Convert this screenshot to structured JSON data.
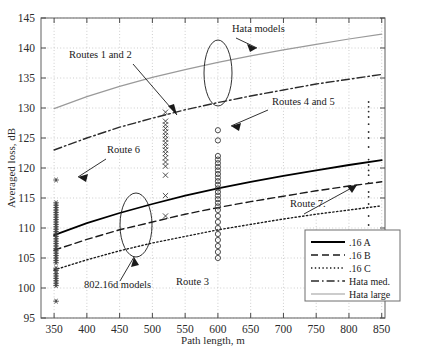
{
  "chart_data": {
    "type": "scatter",
    "title": "",
    "xlabel": "Path length, m",
    "ylabel": "Averaged loss, dB",
    "xlim": [
      330,
      855
    ],
    "ylim": [
      95,
      145
    ],
    "xticks": [
      350,
      400,
      450,
      500,
      550,
      600,
      650,
      700,
      750,
      800,
      850
    ],
    "yticks": [
      95,
      100,
      105,
      110,
      115,
      120,
      125,
      130,
      135,
      140,
      145
    ],
    "grid": "dotted",
    "legend_position": "lower-right",
    "legend": [
      {
        "label": ".16 A",
        "style": "solid",
        "color": "#000000",
        "width": 1.8
      },
      {
        "label": ".16  B",
        "style": "dashed",
        "color": "#1a1a1a",
        "width": 1.5
      },
      {
        "label": ".16 C",
        "style": "dotted",
        "color": "#1a1a1a",
        "width": 1.4
      },
      {
        "label": "Hata med.",
        "style": "dashdot",
        "color": "#2a2a2a",
        "width": 1.4
      },
      {
        "label": "Hata large",
        "style": "solid",
        "color": "#9a9a9a",
        "width": 1.2
      }
    ],
    "series": [
      {
        "name": ".16 A",
        "style": "solid",
        "color": "#000000",
        "x": [
          350,
          400,
          450,
          500,
          550,
          600,
          650,
          700,
          750,
          800,
          850
        ],
        "y": [
          108.8,
          110.8,
          112.5,
          114.0,
          115.4,
          116.6,
          117.7,
          118.7,
          119.6,
          120.5,
          121.3
        ]
      },
      {
        "name": ".16  B",
        "style": "dashed",
        "color": "#1a1a1a",
        "x": [
          350,
          400,
          450,
          500,
          550,
          600,
          650,
          700,
          750,
          800,
          850
        ],
        "y": [
          106.3,
          108.1,
          109.7,
          111.0,
          112.3,
          113.4,
          114.4,
          115.3,
          116.2,
          117.0,
          117.7
        ]
      },
      {
        "name": ".16 C",
        "style": "dotted",
        "color": "#1a1a1a",
        "x": [
          350,
          400,
          450,
          500,
          550,
          600,
          650,
          700,
          750,
          800,
          850
        ],
        "y": [
          103.0,
          104.7,
          106.2,
          107.5,
          108.6,
          109.7,
          110.6,
          111.5,
          112.3,
          113.0,
          113.7
        ]
      },
      {
        "name": "Hata med.",
        "style": "dashdot",
        "color": "#2a2a2a",
        "x": [
          350,
          400,
          450,
          500,
          550,
          600,
          650,
          700,
          750,
          800,
          850
        ],
        "y": [
          123.0,
          125.0,
          126.8,
          128.3,
          129.7,
          130.9,
          132.0,
          133.0,
          134.0,
          134.8,
          135.6
        ]
      },
      {
        "name": "Hata large",
        "style": "solid",
        "color": "#9a9a9a",
        "x": [
          350,
          400,
          450,
          500,
          550,
          600,
          650,
          700,
          750,
          800,
          850
        ],
        "y": [
          129.9,
          131.9,
          133.6,
          135.1,
          136.4,
          137.6,
          138.7,
          139.7,
          140.6,
          141.5,
          142.3
        ]
      }
    ],
    "scatter_groups": [
      {
        "name": "802.16d models measurement cluster",
        "marker": "asterisk",
        "color": "#3a3a3a",
        "x": 353,
        "y": [
          97.8,
          100.4,
          100.8,
          101.2,
          101.6,
          102.0,
          102.4,
          102.9,
          103.3,
          104.2,
          104.6,
          105.0,
          105.4,
          105.8,
          106.2,
          106.6,
          107.0,
          107.4,
          107.8,
          108.2,
          108.6,
          109.0,
          109.4,
          109.8,
          110.2,
          110.6,
          111.0,
          111.4,
          111.8,
          112.2,
          112.6,
          113.0,
          113.4,
          113.8,
          114.2,
          118.0
        ]
      },
      {
        "name": "Routes 1 and 2 cluster",
        "marker": "cross",
        "color": "#3a3a3a",
        "x": 520,
        "y": [
          112.0,
          115.4,
          118.8,
          120.3,
          121.0,
          121.7,
          122.4,
          123.0,
          123.6,
          124.2,
          124.8,
          125.4,
          126.0,
          126.6,
          127.2,
          127.8,
          129.3
        ]
      },
      {
        "name": "Routes 4 and 5 cluster",
        "marker": "circle",
        "color": "#3a3a3a",
        "x": 600,
        "y": [
          105.0,
          106.0,
          107.0,
          108.0,
          109.0,
          110.0,
          111.0,
          112.0,
          113.0,
          113.6,
          114.2,
          114.8,
          115.4,
          116.0,
          116.6,
          117.2,
          117.8,
          118.4,
          119.0,
          119.6,
          120.2,
          120.8,
          121.4,
          122.0,
          124.6,
          126.3
        ]
      },
      {
        "name": "Route 7 cluster",
        "marker": "dot",
        "color": "#2a2a2a",
        "x": 830,
        "y": [
          103.5,
          105.0,
          108.0,
          110.5,
          112.0,
          114.0,
          115.2,
          116.0,
          117.5,
          118.8,
          119.6,
          120.5,
          121.4,
          123.5,
          125.0,
          126.0,
          127.3,
          128.5,
          129.4,
          130.2,
          131.0
        ]
      }
    ],
    "annotations": [
      {
        "id": "hata-models",
        "text": "Hata models",
        "x": 232,
        "y": 32
      },
      {
        "id": "routes-1-and-2",
        "text": "Routes 1 and 2",
        "x": 69,
        "y": 58
      },
      {
        "id": "routes-4-and-5",
        "text": "Routes 4 and 5",
        "x": 272,
        "y": 105
      },
      {
        "id": "route-6",
        "text": "Route 6",
        "x": 107,
        "y": 153
      },
      {
        "id": "route-7",
        "text": "Route 7.",
        "x": 290,
        "y": 207
      },
      {
        "id": "route-3",
        "text": "Route 3",
        "x": 176,
        "y": 285
      },
      {
        "id": "models-802-16d",
        "text": "802.16d models",
        "x": 84,
        "y": 288
      }
    ]
  }
}
